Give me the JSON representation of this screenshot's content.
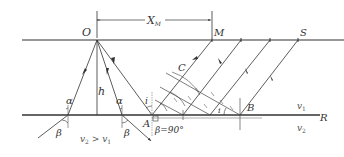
{
  "diagram": {
    "type": "seismic refraction ray diagram",
    "labels": {
      "O": "O",
      "M": "M",
      "S": "S",
      "C": "C",
      "A": "A",
      "B": "B",
      "R": "R",
      "h": "h",
      "alpha": "α",
      "beta": "β",
      "i": "i",
      "xm_main": "X",
      "xm_sub": "M",
      "beta90": "β=90°",
      "v1_main": "v",
      "v1_sub": "1",
      "v2_main": "v",
      "v2_sub": "2",
      "cond_v2": "v",
      "cond_v2_sub": "2",
      "cond_gt": " > ",
      "cond_v1": "v",
      "cond_v1_sub": "1"
    },
    "colors": {
      "line": "#333333",
      "thin": "#555555",
      "text": "#333333"
    }
  }
}
